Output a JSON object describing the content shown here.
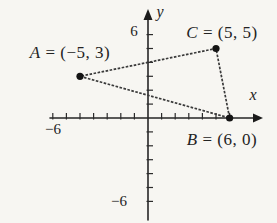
{
  "figure": {
    "points": [
      {
        "name": "A",
        "rest": "= (−5, 3)",
        "x": -5,
        "y": 3
      },
      {
        "name": "B",
        "rest": "= (6, 0)",
        "x": 6,
        "y": 0
      },
      {
        "name": "C",
        "rest": "= (5, 5)",
        "x": 5,
        "y": 5
      }
    ],
    "axis": {
      "x_letter": "x",
      "y_letter": "y",
      "x_ticks": [
        -7,
        -6,
        -5,
        -4,
        -3,
        -2,
        -1,
        1,
        2,
        3,
        4,
        5,
        6
      ],
      "y_ticks": [
        -6,
        -5,
        -4,
        -3,
        -2,
        -1,
        1,
        2,
        3,
        4,
        5,
        6
      ],
      "x_neg_tick_label": "−6",
      "y_pos_tick_label": "6",
      "y_neg_tick_label": "−6"
    },
    "colors": {
      "ink": "#262626",
      "background": "#f7f6f2"
    }
  }
}
